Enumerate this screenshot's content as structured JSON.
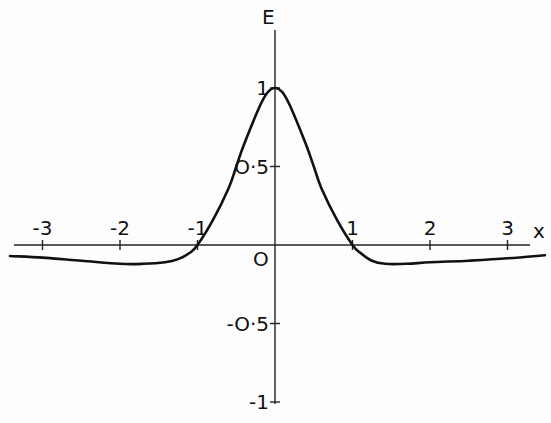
{
  "chart_data": {
    "type": "line",
    "title": "",
    "xlabel": "x",
    "ylabel": "E",
    "xlim": [
      -3.4,
      3.5
    ],
    "ylim": [
      -1,
      1.3
    ],
    "grid": false,
    "legend": null,
    "x_ticks": [
      -3,
      -2,
      -1,
      1,
      2,
      3
    ],
    "x_tick_labels": [
      "-3",
      "-2",
      "-1",
      "1",
      "2",
      "3"
    ],
    "y_ticks": [
      1,
      0.5,
      -0.5,
      -1
    ],
    "y_tick_labels": [
      "1",
      "O·5",
      "-O·5",
      "-1"
    ],
    "origin_label": "O",
    "series": [
      {
        "name": "E(x)",
        "x": [
          -3.4,
          -3.0,
          -2.5,
          -2.0,
          -1.7,
          -1.42,
          -1.25,
          -1.1,
          -1.0,
          -0.8,
          -0.6,
          -0.5,
          -0.4,
          -0.2,
          -0.1,
          0.0,
          0.1,
          0.2,
          0.4,
          0.5,
          0.6,
          0.8,
          1.0,
          1.1,
          1.25,
          1.42,
          1.7,
          2.0,
          2.5,
          3.0,
          3.5
        ],
        "y": [
          -0.07,
          -0.08,
          -0.1,
          -0.12,
          -0.12,
          -0.11,
          -0.09,
          -0.05,
          0.0,
          0.16,
          0.36,
          0.5,
          0.64,
          0.88,
          0.97,
          1.0,
          0.97,
          0.88,
          0.64,
          0.5,
          0.36,
          0.16,
          0.0,
          -0.05,
          -0.1,
          -0.12,
          -0.12,
          -0.11,
          -0.1,
          -0.085,
          -0.065
        ]
      }
    ]
  },
  "axes": {
    "x_label": "x",
    "y_label": "E",
    "origin": "O"
  }
}
